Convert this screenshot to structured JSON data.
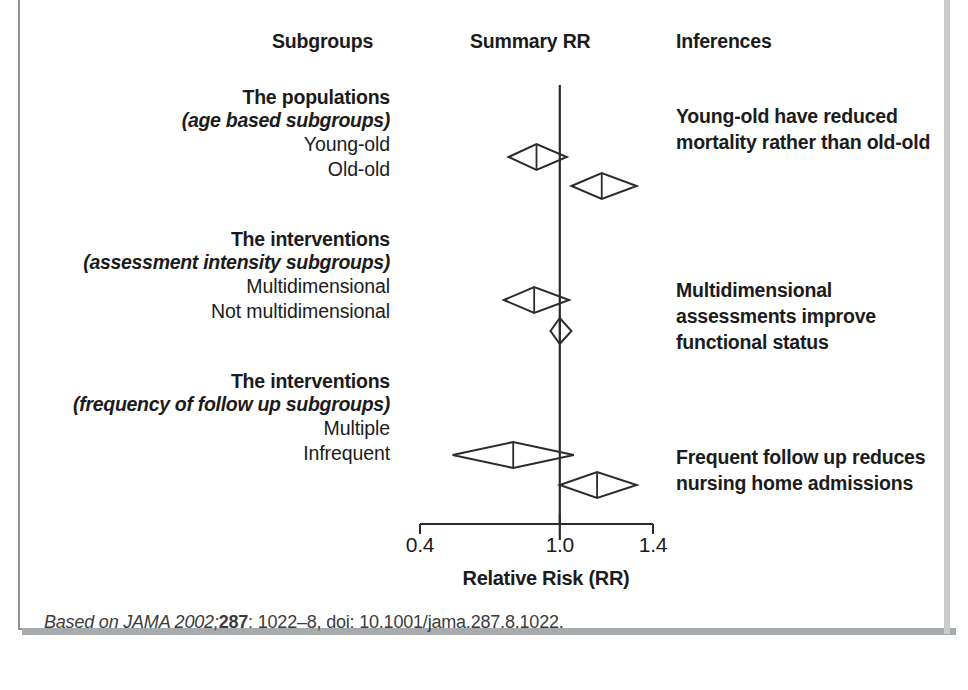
{
  "figure": {
    "top_clipped_text": "subgroup analyses from a meta-analysis of comprehensive geriatric assessment programmes",
    "headers": {
      "subgroups": "Subgroups",
      "summary": "Summary RR",
      "inferences": "Inferences"
    },
    "source_note": {
      "prefix": "Based on JAMA 2002;",
      "volume": "287",
      "suffix": ": 1022–8, doi: 10.1001/jama.287.8.1022."
    }
  },
  "subgroup_blocks": [
    {
      "title": "The populations",
      "subtitle": "(age based subgroups)",
      "items": [
        "Young-old",
        "Old-old"
      ],
      "inference": "Young-old have reduced mortality rather than old-old"
    },
    {
      "title": "The interventions",
      "subtitle": "(assessment intensity subgroups)",
      "items": [
        "Multidimensional",
        "Not multidimensional"
      ],
      "inference": "Multidimensional assessments improve functional status"
    },
    {
      "title": "The interventions",
      "subtitle": "(frequency of follow up subgroups)",
      "items": [
        "Multiple",
        "Infrequent"
      ],
      "inference": "Frequent follow up reduces nursing home admissions"
    }
  ],
  "chart_data": {
    "type": "forest",
    "title": "",
    "xlabel": "Relative Risk (RR)",
    "ylabel": "",
    "xlim": [
      0.4,
      1.4
    ],
    "xticks": [
      0.4,
      1.0,
      1.4
    ],
    "xtick_labels": [
      "0.4",
      "1.0",
      "1.4"
    ],
    "reference_line": 1.0,
    "grid": false,
    "legend": "none",
    "marker": "diamond",
    "series": [
      {
        "name": "Young-old",
        "group": "The populations (age based subgroups)",
        "rr": 0.9,
        "ci_low": 0.78,
        "ci_high": 1.03
      },
      {
        "name": "Old-old",
        "group": "The populations (age based subgroups)",
        "rr": 1.18,
        "ci_low": 1.05,
        "ci_high": 1.33
      },
      {
        "name": "Multidimensional",
        "group": "The interventions (assessment intensity subgroups)",
        "rr": 0.89,
        "ci_low": 0.76,
        "ci_high": 1.04
      },
      {
        "name": "Not multidimensional",
        "group": "The interventions (assessment intensity subgroups)",
        "rr": 1.0,
        "ci_low": 0.96,
        "ci_high": 1.05
      },
      {
        "name": "Multiple",
        "group": "The interventions (frequency of follow up subgroups)",
        "rr": 0.8,
        "ci_low": 0.54,
        "ci_high": 1.06
      },
      {
        "name": "Infrequent",
        "group": "The interventions (frequency of follow up subgroups)",
        "rr": 1.16,
        "ci_low": 1.0,
        "ci_high": 1.33
      }
    ]
  }
}
